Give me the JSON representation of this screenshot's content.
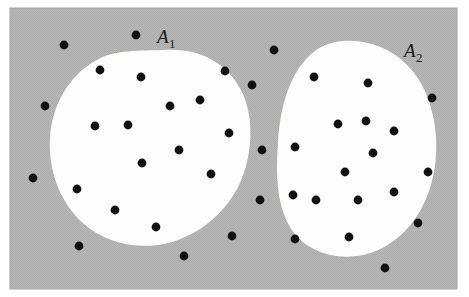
{
  "figure": {
    "kind": "set-diagram",
    "frame": {
      "x": 10,
      "y": 8,
      "width": 447,
      "height": 281,
      "background_color": "#b4b4b4",
      "page_color": "#ffffff",
      "border_color": "#a8a8a8"
    },
    "colors": {
      "shaded_background": "#b4b4b4",
      "region_fill": "#fdfdfb",
      "point_color": "#111111",
      "label_color": "#1a1a1a"
    },
    "point_radius": 4.4
  },
  "labels": [
    {
      "id": "A1",
      "base": "A",
      "subscript": "1",
      "x": 157,
      "y": 43,
      "anchor_region": "region-a1"
    },
    {
      "id": "A2",
      "base": "A",
      "subscript": "2",
      "x": 404,
      "y": 57,
      "anchor_region": "region-a2"
    }
  ],
  "regions": [
    {
      "id": "region-a1",
      "label": "A1",
      "fill": "#fdfdfb",
      "path": "M 163 50 C 199 47 228 63 242 92 C 255 120 252 156 240 183 C 227 211 202 233 172 242 C 141 251 107 244 84 224 C 60 203 48 170 50 138 C 52 105 69 76 95 61 C 115 49 140 51 163 50 Z"
    },
    {
      "id": "region-a2",
      "label": "A2",
      "fill": "#fdfdfb",
      "path": "M 343 41 C 379 39 409 58 424 89 C 438 119 440 156 430 188 C 420 220 397 246 367 254 C 337 262 305 252 290 227 C 276 203 276 172 278 142 C 280 110 288 78 307 58 C 317 47 330 42 343 41 Z"
    }
  ],
  "points": {
    "inside_a1": [
      {
        "x": 141,
        "y": 77
      },
      {
        "x": 225,
        "y": 71
      },
      {
        "x": 170,
        "y": 106
      },
      {
        "x": 200,
        "y": 100
      },
      {
        "x": 95,
        "y": 126
      },
      {
        "x": 128,
        "y": 125
      },
      {
        "x": 229,
        "y": 133
      },
      {
        "x": 179,
        "y": 150
      },
      {
        "x": 142,
        "y": 163
      },
      {
        "x": 211,
        "y": 174
      },
      {
        "x": 77,
        "y": 189
      },
      {
        "x": 115,
        "y": 210
      },
      {
        "x": 156,
        "y": 227
      }
    ],
    "inside_a2": [
      {
        "x": 314,
        "y": 77
      },
      {
        "x": 368,
        "y": 83
      },
      {
        "x": 338,
        "y": 124
      },
      {
        "x": 366,
        "y": 121
      },
      {
        "x": 394,
        "y": 131
      },
      {
        "x": 295,
        "y": 147
      },
      {
        "x": 373,
        "y": 153
      },
      {
        "x": 345,
        "y": 172
      },
      {
        "x": 293,
        "y": 195
      },
      {
        "x": 316,
        "y": 200
      },
      {
        "x": 358,
        "y": 200
      },
      {
        "x": 394,
        "y": 192
      },
      {
        "x": 295,
        "y": 239
      },
      {
        "x": 349,
        "y": 237
      }
    ],
    "outside": [
      {
        "x": 136,
        "y": 35
      },
      {
        "x": 64,
        "y": 45
      },
      {
        "x": 100,
        "y": 70
      },
      {
        "x": 45,
        "y": 106
      },
      {
        "x": 33,
        "y": 178
      },
      {
        "x": 79,
        "y": 246
      },
      {
        "x": 184,
        "y": 256
      },
      {
        "x": 232,
        "y": 236
      },
      {
        "x": 274,
        "y": 50
      },
      {
        "x": 252,
        "y": 85
      },
      {
        "x": 262,
        "y": 150
      },
      {
        "x": 260,
        "y": 200
      },
      {
        "x": 432,
        "y": 98
      },
      {
        "x": 428,
        "y": 172
      },
      {
        "x": 418,
        "y": 223
      },
      {
        "x": 385,
        "y": 268
      }
    ]
  }
}
